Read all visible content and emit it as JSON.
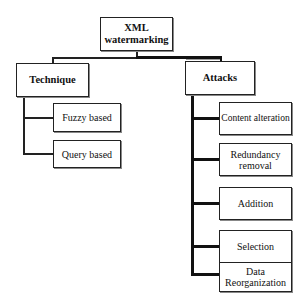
{
  "diagram": {
    "root": {
      "label": "XML watermarking",
      "line1": "XML",
      "line2": "watermarking"
    },
    "branches": [
      {
        "label": "Technique",
        "children": [
          "Fuzzy based",
          "Query based"
        ]
      },
      {
        "label": "Attacks",
        "children": [
          {
            "label": "Content alteration"
          },
          {
            "label": "Redundancy removal",
            "line1": "Redundancy",
            "line2": "removal"
          },
          {
            "label": "Addition"
          },
          {
            "label": "Selection"
          },
          {
            "label": "Data Reorganization",
            "line1": "Data",
            "line2": "Reorganization"
          }
        ]
      }
    ]
  }
}
